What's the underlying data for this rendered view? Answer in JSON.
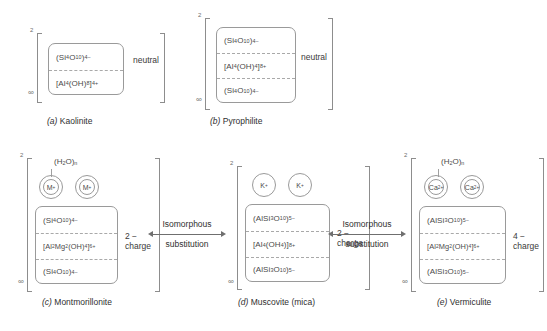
{
  "figure": {
    "panels": [
      {
        "id": "kaolinite",
        "tag": "(a)",
        "name": "Kaolinite",
        "bracket_superscript": "2",
        "bracket_subscript": "∞",
        "charge_label": "neutral",
        "layers": [
          {
            "formula_html": "(Si<sub>4</sub>O<sub>10</sub>)<sup>4−</sup>"
          },
          {
            "formula_html": "[Al<sub>4</sub>(OH)<sub>8</sub>]<sup>4+</sup>"
          }
        ],
        "cations": []
      },
      {
        "id": "pyrophilite",
        "tag": "(b)",
        "name": "Pyrophilite",
        "bracket_superscript": "2",
        "bracket_subscript": "∞",
        "charge_label": "neutral",
        "layers": [
          {
            "formula_html": "(Si<sub>4</sub>O<sub>10</sub>)<sup>4−</sup>"
          },
          {
            "formula_html": "[Al<sub>4</sub>(OH)<sub>4</sub>]<sup>8+</sup>"
          },
          {
            "formula_html": "(Si<sub>4</sub>O<sub>10</sub>)<sup>4−</sup>"
          }
        ],
        "cations": []
      },
      {
        "id": "montmorillonite",
        "tag": "(c)",
        "name": "Montmorillonite",
        "bracket_superscript": "2",
        "bracket_subscript": "∞",
        "charge_label_line1": "2 −",
        "charge_label_line2": "charge",
        "water_label_html": "(H<sub>2</sub>O)<sub>n</sub>",
        "layers": [
          {
            "formula_html": "(Si<sub>4</sub>O<sub>10</sub>)<sup>4−</sup>"
          },
          {
            "formula_html": "[Al<sub>2</sub>Mg<sub>2</sub>(OH)<sub>4</sub>]<sup>6+</sup>"
          },
          {
            "formula_html": "(Si<sub>4</sub>O<sub>10</sub>)<sup>4−</sup>"
          }
        ],
        "cations": [
          {
            "label_html": "M<sup>+</sup>",
            "hydrated": true
          },
          {
            "label_html": "M<sup>+</sup>",
            "hydrated": true
          }
        ]
      },
      {
        "id": "muscovite",
        "tag": "(d)",
        "name": "Muscovite (mica)",
        "bracket_superscript": "2",
        "bracket_subscript": "∞",
        "charge_label_line1": "2 −",
        "charge_label_line2": "charge",
        "water_label_html": "",
        "layers": [
          {
            "formula_html": "(AlSi<sub>3</sub>O<sub>10</sub>)<sup>5−</sup>"
          },
          {
            "formula_html": "[Al<sub>4</sub>(OH<sub>4</sub>)]<sup>8+</sup>"
          },
          {
            "formula_html": "(AlSi<sub>3</sub>O<sub>10</sub>)<sup>5−</sup>"
          }
        ],
        "cations": [
          {
            "label_html": "K<sup>+</sup>",
            "hydrated": false
          },
          {
            "label_html": "K<sup>+</sup>",
            "hydrated": false
          }
        ]
      },
      {
        "id": "vermiculite",
        "tag": "(e)",
        "name": "Vermiculite",
        "bracket_superscript": "2",
        "bracket_subscript": "∞",
        "charge_label_line1": "4 −",
        "charge_label_line2": "charge",
        "water_label_html": "(H<sub>2</sub>O)<sub>n</sub>",
        "layers": [
          {
            "formula_html": "(AlSi<sub>3</sub>O<sub>10</sub>)<sup>5−</sup>"
          },
          {
            "formula_html": "[Al<sub>2</sub>Mg<sub>2</sub>(OH)<sub>4</sub>]<sup>6+</sup>"
          },
          {
            "formula_html": "(AlSi<sub>3</sub>O<sub>10</sub>)<sup>5−</sup>"
          }
        ],
        "cations": [
          {
            "label_html": "Ca<sup>2+</sup>",
            "hydrated": true
          },
          {
            "label_html": "Ca<sup>2+</sup>",
            "hydrated": true
          }
        ]
      }
    ],
    "arrows": [
      {
        "id": "arrow-left",
        "line1": "Isomorphous",
        "line2": "substitution",
        "direction": "both"
      },
      {
        "id": "arrow-right",
        "line1": "Isomorphous",
        "line2": "substitution",
        "direction": "both"
      }
    ],
    "figure_label": ""
  }
}
